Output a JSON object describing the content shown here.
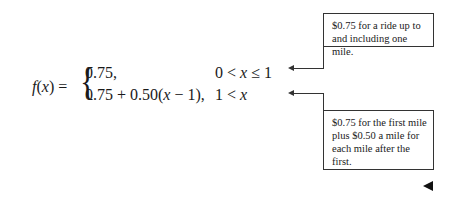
{
  "equation": {
    "lhs": "f(x) = ",
    "cases": [
      {
        "expr": "0.75,",
        "condition": "0 < x ≤ 1"
      },
      {
        "expr": "0.75 + 0.50(x − 1),",
        "condition": "1 < x"
      }
    ]
  },
  "annotations": [
    {
      "text": "$0.75 for a ride up to and including one mile."
    },
    {
      "text": "$0.75 for the first mile plus $0.50 a mile for each mile after the first."
    }
  ],
  "nav": {
    "icon": "left-triangle-icon"
  }
}
